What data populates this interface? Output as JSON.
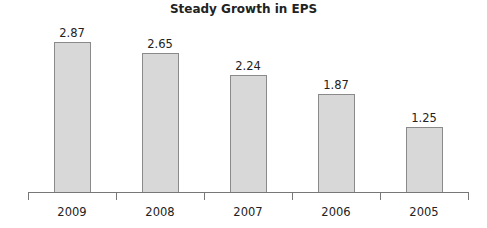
{
  "chart_data": {
    "type": "bar",
    "title": "Steady Growth in EPS",
    "categories": [
      "2009",
      "2008",
      "2007",
      "2006",
      "2005"
    ],
    "values": [
      2.87,
      2.65,
      2.24,
      1.87,
      1.25
    ],
    "value_labels": [
      "2.87",
      "2.65",
      "2.24",
      "1.87",
      "1.25"
    ],
    "xlabel": "",
    "ylabel": "",
    "ylim": [
      0,
      3
    ],
    "grid": false,
    "legend": null,
    "colors": {
      "bar_fill": "#d8d8d8",
      "bar_border": "#8a8a8a",
      "axis": "#777777"
    }
  }
}
